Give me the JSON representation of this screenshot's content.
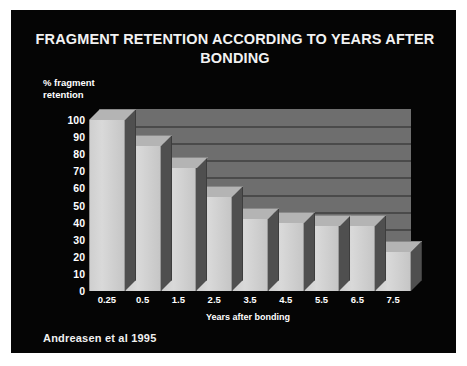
{
  "slide": {
    "background_color": "#050505",
    "title": "FRAGMENT RETENTION ACCORDING TO YEARS AFTER BONDING",
    "citation": "Andreasen et al 1995"
  },
  "chart_data": {
    "type": "bar",
    "title": "FRAGMENT RETENTION ACCORDING TO YEARS AFTER BONDING",
    "categories": [
      "0.25",
      "0.5",
      "1.5",
      "2.5",
      "3.5",
      "4.5",
      "5.5",
      "6.5",
      "7.5"
    ],
    "values": [
      100,
      85,
      72,
      55,
      42,
      40,
      38,
      38,
      23
    ],
    "xlabel": "Years after bonding",
    "ylabel": "% fragment\nretention",
    "ylim": [
      0,
      100
    ],
    "yticks": [
      "100",
      "90",
      "80",
      "70",
      "60",
      "50",
      "40",
      "30",
      "20",
      "10",
      "0"
    ],
    "ytick_values": [
      100,
      90,
      80,
      70,
      60,
      50,
      40,
      30,
      20,
      10,
      0
    ],
    "grid": true,
    "legend": "none",
    "style": "3d",
    "series_name": "% fragment retention",
    "colors": {
      "bar_front": "#d2d2d2",
      "bar_top": "#b4b4b4",
      "bar_side": "#4f4f4f",
      "plot_wall": "#6e6e6e",
      "gridline": "#4a4a4a",
      "text": "#ffffff",
      "background": "#050505"
    }
  }
}
